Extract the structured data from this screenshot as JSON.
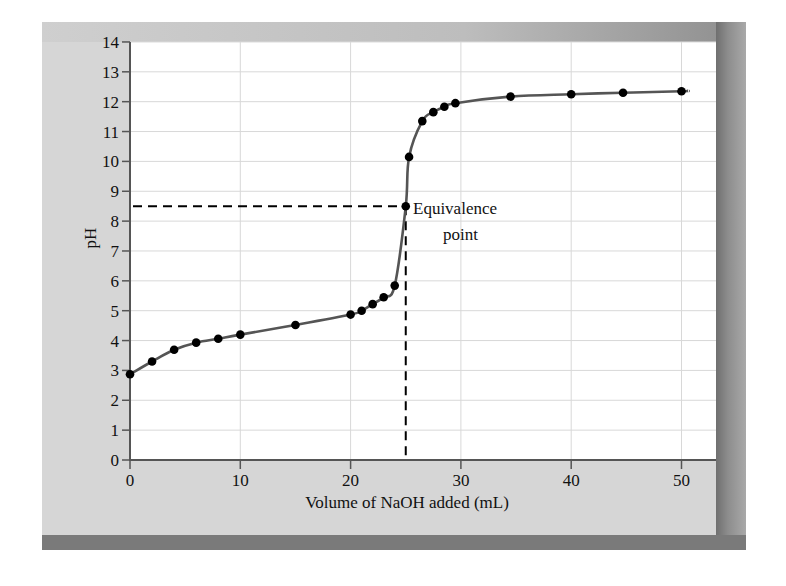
{
  "chart_data": {
    "type": "scatter",
    "title": "",
    "xlabel": "Volume of NaOH added (mL)",
    "ylabel": "pH",
    "xlim": [
      0,
      53
    ],
    "ylim": [
      0,
      14
    ],
    "x_ticks": [
      0,
      10,
      20,
      30,
      40,
      50
    ],
    "y_ticks": [
      0,
      1,
      2,
      3,
      4,
      5,
      6,
      7,
      8,
      9,
      10,
      11,
      12,
      13,
      14
    ],
    "grid": true,
    "legend": null,
    "series": [
      {
        "name": "Titration curve",
        "style": "markers with smooth line",
        "x": [
          0,
          2,
          4,
          6,
          8,
          10,
          15,
          20,
          21,
          22,
          23,
          24,
          25,
          25.3,
          26.5,
          27.5,
          28.5,
          29.5,
          34.5,
          40,
          44.7,
          50
        ],
        "y": [
          2.87,
          3.3,
          3.69,
          3.93,
          4.06,
          4.2,
          4.52,
          4.87,
          5.0,
          5.22,
          5.45,
          5.84,
          8.5,
          10.15,
          11.35,
          11.65,
          11.83,
          11.95,
          12.17,
          12.25,
          12.3,
          12.35
        ]
      }
    ],
    "annotations": [
      {
        "text": "Equivalence point",
        "x": 25,
        "y": 8.5,
        "guides": "dashed lines to x-axis and y-axis"
      }
    ]
  },
  "labels": {
    "xlabel": "Volume of NaOH added (mL)",
    "ylabel": "pH",
    "annotation_line1": "Equivalence",
    "annotation_line2": "point",
    "x_ticks": [
      "0",
      "10",
      "20",
      "30",
      "40",
      "50"
    ],
    "y_ticks": [
      "0",
      "1",
      "2",
      "3",
      "4",
      "5",
      "6",
      "7",
      "8",
      "9",
      "10",
      "11",
      "12",
      "13",
      "14"
    ]
  },
  "colors": {
    "curve": "#555555",
    "markers": "#000000",
    "grid": "#d8d8d8",
    "panel": "#d6d6d6",
    "plot_bg": "#ffffff"
  }
}
